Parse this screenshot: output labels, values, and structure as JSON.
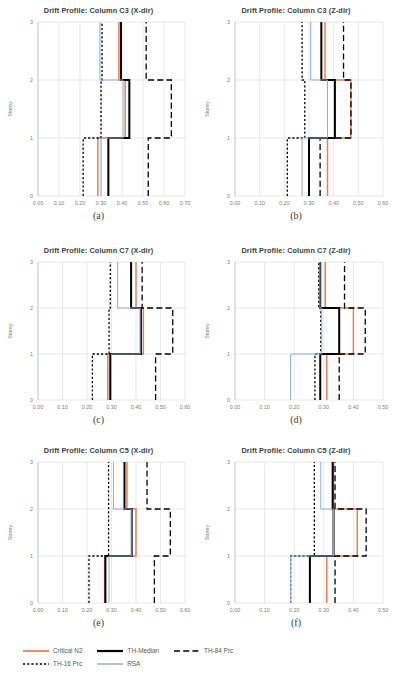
{
  "figure": {
    "ylabel": "Storey",
    "storey_ticks": [
      "0",
      "1",
      "2",
      "3"
    ]
  },
  "colors": {
    "critical_n2": "#ED7D5A",
    "th_median": "#000000",
    "th_84": "#000000",
    "th_16": "#000000",
    "rsa": "#8FAADC",
    "grid": "#D9D9D9",
    "axis_text": "#808080",
    "title_text": "#404040"
  },
  "legend": {
    "rows": [
      [
        {
          "label": "Critical N2",
          "style": "solid",
          "color": "#ED7D5A",
          "width": 1.8,
          "name": "critical-n2"
        },
        {
          "label": "TH-Median",
          "style": "solid",
          "color": "#000000",
          "width": 2.2,
          "name": "th-median"
        },
        {
          "label": "TH-84 Prc",
          "style": "longdash",
          "color": "#000000",
          "width": 1.4,
          "name": "th-84-prc"
        }
      ],
      [
        {
          "label": "TH-16 Prc",
          "style": "dash",
          "color": "#000000",
          "width": 1.4,
          "name": "th-16-prc"
        },
        {
          "label": "RSA",
          "style": "solid",
          "color": "#8FAADC",
          "width": 1.4,
          "name": "rsa"
        }
      ]
    ]
  },
  "chart_data": [
    {
      "id": "a",
      "panel_label": "(a)",
      "type": "line",
      "title": "Drift Profile: Column C3 (X-dir)",
      "xlabel": "",
      "ylabel": "Storey",
      "xlim": [
        0.0,
        0.7
      ],
      "xticks": [
        "0.00",
        "0.10",
        "0.20",
        "0.30",
        "0.40",
        "0.50",
        "0.60",
        "0.70"
      ],
      "ylim": [
        0,
        3
      ],
      "yticks": [
        "0",
        "1",
        "2",
        "3"
      ],
      "grid": true,
      "storeys": [
        0,
        1,
        2,
        3
      ],
      "series": [
        {
          "name": "Critical N2",
          "values": [
            0.285,
            0.285,
            0.415,
            0.385
          ]
        },
        {
          "name": "TH-Median",
          "values": [
            0.335,
            0.335,
            0.435,
            0.395
          ]
        },
        {
          "name": "TH-84 Prc",
          "values": [
            0.525,
            0.525,
            0.635,
            0.515
          ]
        },
        {
          "name": "TH-16 Prc",
          "values": [
            0.215,
            0.215,
            0.3,
            0.305
          ]
        },
        {
          "name": "RSA",
          "values": [
            0.3,
            0.3,
            0.405,
            0.295
          ]
        }
      ]
    },
    {
      "id": "b",
      "panel_label": "(b)",
      "type": "line",
      "title": "Drift Profile: Column C3 (Z-dir)",
      "xlabel": "",
      "ylabel": "Storey",
      "xlim": [
        0.0,
        0.6
      ],
      "xticks": [
        "0.00",
        "0.10",
        "0.20",
        "0.30",
        "0.40",
        "0.50",
        "0.60"
      ],
      "ylim": [
        0,
        3
      ],
      "yticks": [
        "0",
        "1",
        "2",
        "3"
      ],
      "grid": true,
      "storeys": [
        0,
        1,
        2,
        3
      ],
      "series": [
        {
          "name": "Critical N2",
          "values": [
            0.375,
            0.375,
            0.47,
            0.365
          ]
        },
        {
          "name": "TH-Median",
          "values": [
            0.3,
            0.3,
            0.405,
            0.35
          ]
        },
        {
          "name": "TH-84 Prc",
          "values": [
            0.345,
            0.345,
            0.47,
            0.44
          ]
        },
        {
          "name": "TH-16 Prc",
          "values": [
            0.212,
            0.212,
            0.283,
            0.272
          ]
        },
        {
          "name": "RSA",
          "values": [
            0.272,
            0.272,
            0.375,
            0.307
          ]
        }
      ]
    },
    {
      "id": "c",
      "panel_label": "(c)",
      "type": "line",
      "title": "Drift Profile: Column C7 (X-dir)",
      "xlabel": "",
      "ylabel": "Storey",
      "xlim": [
        0.0,
        0.6
      ],
      "xticks": [
        "0.00",
        "0.10",
        "0.20",
        "0.30",
        "0.40",
        "0.50",
        "0.60"
      ],
      "ylim": [
        0,
        3
      ],
      "yticks": [
        "0",
        "1",
        "2",
        "3"
      ],
      "grid": true,
      "storeys": [
        0,
        1,
        2,
        3
      ],
      "series": [
        {
          "name": "Critical N2",
          "values": [
            0.285,
            0.285,
            0.43,
            0.4
          ]
        },
        {
          "name": "TH-Median",
          "values": [
            0.295,
            0.295,
            0.42,
            0.38
          ]
        },
        {
          "name": "TH-84 Prc",
          "values": [
            0.48,
            0.48,
            0.55,
            0.425
          ]
        },
        {
          "name": "TH-16 Prc",
          "values": [
            0.222,
            0.222,
            0.29,
            0.295
          ]
        },
        {
          "name": "RSA",
          "values": [
            0.3,
            0.3,
            0.417,
            0.325
          ]
        }
      ]
    },
    {
      "id": "d",
      "panel_label": "(d)",
      "type": "line",
      "title": "Drift Profile: Column C7 (Z-dir)",
      "xlabel": "",
      "ylabel": "Storey",
      "xlim": [
        0.0,
        0.5
      ],
      "xticks": [
        "0.00",
        "0.10",
        "0.20",
        "0.30",
        "0.40",
        "0.50"
      ],
      "ylim": [
        0,
        3
      ],
      "yticks": [
        "0",
        "1",
        "2",
        "3"
      ],
      "grid": true,
      "storeys": [
        0,
        1,
        2,
        3
      ],
      "series": [
        {
          "name": "Critical N2",
          "values": [
            0.31,
            0.31,
            0.4,
            0.305
          ]
        },
        {
          "name": "TH-Median",
          "values": [
            0.288,
            0.288,
            0.352,
            0.288
          ]
        },
        {
          "name": "TH-84 Prc",
          "values": [
            0.352,
            0.352,
            0.44,
            0.37
          ]
        },
        {
          "name": "TH-16 Prc",
          "values": [
            0.27,
            0.27,
            0.29,
            0.283
          ]
        },
        {
          "name": "RSA",
          "values": [
            0.188,
            0.188,
            0.293,
            0.287
          ]
        }
      ]
    },
    {
      "id": "e",
      "panel_label": "(e)",
      "type": "line",
      "title": "Drift Profile: Column C5 (X-dir)",
      "xlabel": "",
      "ylabel": "Storey",
      "xlim": [
        0.0,
        0.6
      ],
      "xticks": [
        "0.00",
        "0.10",
        "0.20",
        "0.30",
        "0.40",
        "0.50",
        "0.60"
      ],
      "ylim": [
        0,
        3
      ],
      "yticks": [
        "0",
        "1",
        "2",
        "3"
      ],
      "grid": true,
      "storeys": [
        0,
        1,
        2,
        3
      ],
      "series": [
        {
          "name": "Critical N2",
          "values": [
            0.272,
            0.272,
            0.4,
            0.363
          ]
        },
        {
          "name": "TH-Median",
          "values": [
            0.275,
            0.275,
            0.383,
            0.353
          ]
        },
        {
          "name": "TH-84 Prc",
          "values": [
            0.475,
            0.475,
            0.54,
            0.445
          ]
        },
        {
          "name": "TH-16 Prc",
          "values": [
            0.208,
            0.208,
            0.288,
            0.288
          ]
        },
        {
          "name": "RSA",
          "values": [
            0.29,
            0.29,
            0.383,
            0.308
          ]
        }
      ]
    },
    {
      "id": "f",
      "panel_label": "(f)",
      "type": "line",
      "title": "Drift Profile: Column C5 (Z-dir)",
      "xlabel": "",
      "ylabel": "Storey",
      "xlim": [
        0.0,
        0.5
      ],
      "xticks": [
        "0.00",
        "0.10",
        "0.20",
        "0.30",
        "0.40",
        "0.50"
      ],
      "ylim": [
        0,
        3
      ],
      "yticks": [
        "0",
        "1",
        "2",
        "3"
      ],
      "grid": true,
      "storeys": [
        0,
        1,
        2,
        3
      ],
      "series": [
        {
          "name": "Critical N2",
          "values": [
            0.31,
            0.31,
            0.413,
            0.333
          ]
        },
        {
          "name": "TH-Median",
          "values": [
            0.253,
            0.253,
            0.333,
            0.33
          ]
        },
        {
          "name": "TH-84 Prc",
          "values": [
            0.338,
            0.338,
            0.443,
            0.338
          ]
        },
        {
          "name": "TH-16 Prc",
          "values": [
            0.188,
            0.188,
            0.268,
            0.268
          ]
        },
        {
          "name": "RSA",
          "values": [
            0.188,
            0.188,
            0.333,
            0.29
          ]
        }
      ]
    }
  ]
}
